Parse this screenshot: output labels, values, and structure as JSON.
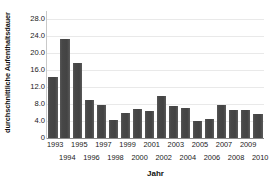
{
  "chart_data": {
    "type": "bar",
    "title": "",
    "xlabel": "Jahr",
    "ylabel": "durchschnittliche Aufenthaltsdauer",
    "categories": [
      "1993",
      "1994",
      "1995",
      "1996",
      "1997",
      "1998",
      "1999",
      "2000",
      "2001",
      "2002",
      "2003",
      "2004",
      "2005",
      "2006",
      "2007",
      "2008",
      "2009",
      "2010"
    ],
    "values": [
      14.3,
      23.5,
      17.7,
      9.0,
      7.7,
      4.3,
      6.0,
      6.8,
      6.3,
      10.0,
      7.5,
      7.1,
      4.1,
      4.6,
      7.9,
      6.5,
      6.6,
      5.7
    ],
    "ylim": [
      0,
      30
    ],
    "yticks": [
      0,
      4,
      8,
      12,
      16,
      20,
      24,
      28
    ],
    "ytick_labels": [
      "0",
      "4.0",
      "8.0",
      "12.0",
      "16.0",
      "20.0",
      "24.0",
      "28.0"
    ],
    "grid": true,
    "legend": false,
    "bar_color": "#4b4b4b",
    "grid_color": "#e9e9e9",
    "axis_color": "#8a8a8a"
  }
}
